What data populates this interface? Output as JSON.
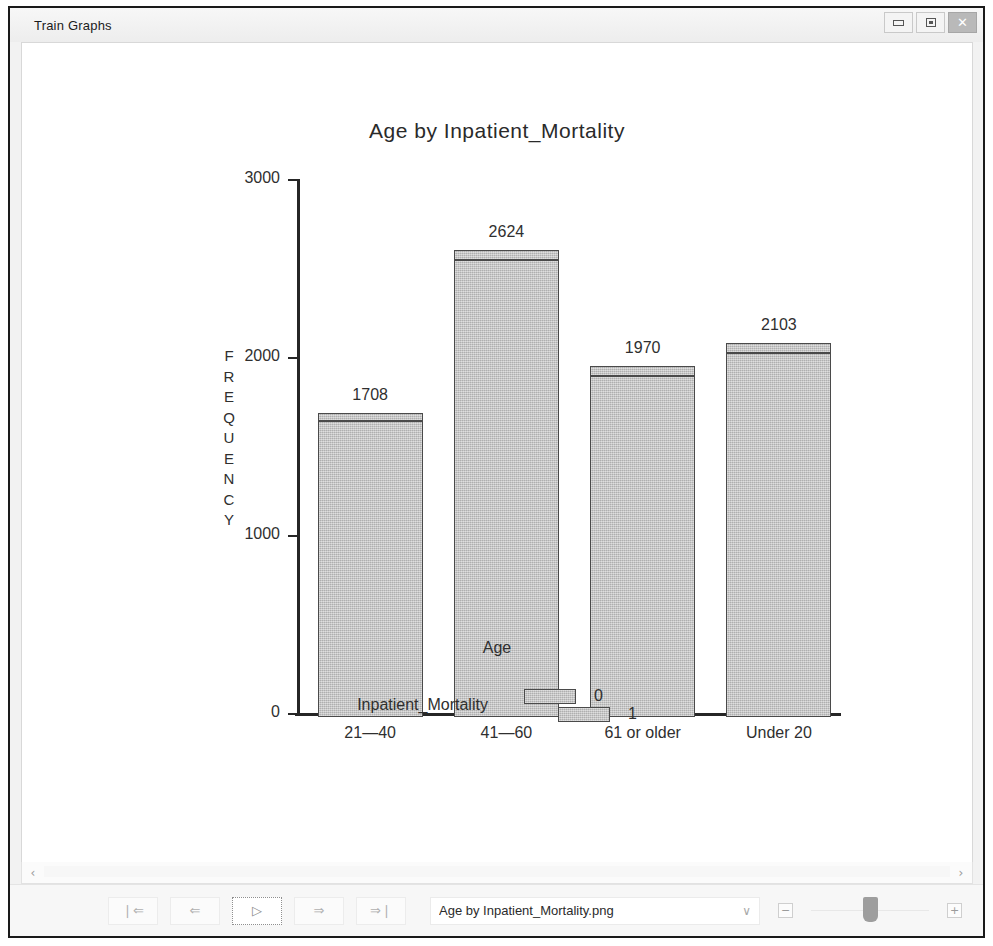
{
  "window": {
    "title": "Train Graphs",
    "controls": {
      "minimize": "minimize",
      "maximize": "maximize",
      "close": "✕"
    }
  },
  "chart_data": {
    "type": "bar",
    "subtype": "stacked-vertical",
    "title": "Age  by  Inpatient_Mortality",
    "xlabel": "Age",
    "ylabel": "FREQUENCY",
    "categories": [
      "21—40",
      "41—60",
      "61 or older",
      "Under 20"
    ],
    "totals": [
      1708,
      2624,
      1970,
      2103
    ],
    "total_labels": [
      "1708",
      "2624",
      "1970",
      "2103"
    ],
    "series": [
      {
        "name": "0",
        "values": [
          1665,
          2570,
          1915,
          2045
        ]
      },
      {
        "name": "1",
        "values": [
          43,
          54,
          55,
          58
        ]
      }
    ],
    "ylim": [
      0,
      3000
    ],
    "yticks": [
      0,
      1000,
      2000,
      3000
    ],
    "ytick_labels": [
      "0",
      "1000",
      "2000",
      "3000"
    ],
    "grid": false,
    "legend": {
      "title": "Inpatient_Mortality",
      "position": "bottom",
      "entries": [
        "0",
        "1"
      ]
    },
    "bar_color": "#c3c3c3",
    "bar_border_color": "#4a4a4a",
    "axis_color": "#262626"
  },
  "scrollbar": {
    "left_arrow": "‹",
    "right_arrow": "›"
  },
  "toolbar": {
    "nav": [
      {
        "name": "first",
        "glyph": "❘⇐"
      },
      {
        "name": "previous",
        "glyph": "⇐"
      },
      {
        "name": "play",
        "glyph": "▷"
      },
      {
        "name": "next",
        "glyph": "⇒"
      },
      {
        "name": "last",
        "glyph": "⇒❘"
      }
    ],
    "file_select": {
      "value": "Age by Inpatient_Mortality.png",
      "chevron": "∨"
    },
    "zoom_out": "−",
    "zoom_in": "+"
  }
}
